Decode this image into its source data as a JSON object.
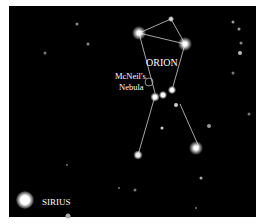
{
  "labels": {
    "constellation": "ORION",
    "nebula_line1": "McNeil's",
    "nebula_line2": "Nebula",
    "bright_star": "SIRIUS"
  },
  "colors": {
    "sky": "#000000",
    "lines": "#d8d8d8",
    "text": "#ffffff"
  }
}
